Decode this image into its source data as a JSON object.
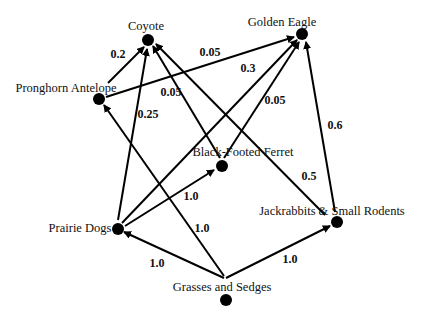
{
  "nodes": {
    "coyote": {
      "label": "Coyote"
    },
    "golden_eagle": {
      "label": "Golden Eagle"
    },
    "pronghorn": {
      "label": "Pronghorn Antelope"
    },
    "ferret": {
      "label": "Black-Footed Ferret"
    },
    "prairie_dogs": {
      "label": "Prairie Dogs"
    },
    "jackrabbits": {
      "label": "Jackrabbits & Small Rodents"
    },
    "grasses": {
      "label": "Grasses and Sedges"
    }
  },
  "edges": [
    {
      "from": "Pronghorn Antelope",
      "to": "Coyote",
      "weight": "0.2"
    },
    {
      "from": "Pronghorn Antelope",
      "to": "Golden Eagle",
      "weight": "0.05"
    },
    {
      "from": "Prairie Dogs",
      "to": "Coyote",
      "weight": "0.25"
    },
    {
      "from": "Black-Footed Ferret",
      "to": "Coyote",
      "weight": "0.05"
    },
    {
      "from": "Jackrabbits & Small Rodents",
      "to": "Coyote",
      "weight": "0.5"
    },
    {
      "from": "Prairie Dogs",
      "to": "Golden Eagle",
      "weight": "0.3"
    },
    {
      "from": "Black-Footed Ferret",
      "to": "Golden Eagle",
      "weight": "0.05"
    },
    {
      "from": "Jackrabbits & Small Rodents",
      "to": "Golden Eagle",
      "weight": "0.6"
    },
    {
      "from": "Prairie Dogs",
      "to": "Black-Footed Ferret",
      "weight": "1.0"
    },
    {
      "from": "Grasses and Sedges",
      "to": "Pronghorn Antelope",
      "weight": "1.0"
    },
    {
      "from": "Grasses and Sedges",
      "to": "Prairie Dogs",
      "weight": "1.0"
    },
    {
      "from": "Grasses and Sedges",
      "to": "Jackrabbits & Small Rodents",
      "weight": "1.0"
    }
  ]
}
